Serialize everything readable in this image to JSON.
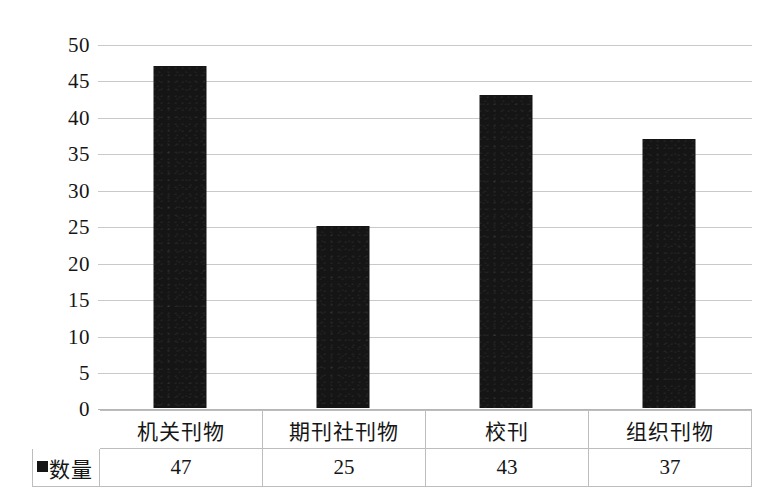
{
  "chart_data": {
    "type": "bar",
    "title": "",
    "subtitle": "",
    "xlabel": "",
    "ylabel": "",
    "categories": [
      "机关刊物",
      "期刊社刊物",
      "校刊",
      "组织刊物"
    ],
    "values": [
      47,
      25,
      43,
      37
    ],
    "series": [
      {
        "name": "数量",
        "values": [
          47,
          25,
          43,
          37
        ]
      }
    ],
    "ylim": [
      0,
      50
    ],
    "ytick_step": 5,
    "yticks": [
      50,
      45,
      40,
      35,
      30,
      25,
      20,
      15,
      10,
      5,
      0
    ],
    "ytick_labels": [
      "50",
      "45",
      "40",
      "35",
      "30",
      "25",
      "20",
      "15",
      "10",
      "5",
      "0"
    ],
    "grid": true,
    "grid_axis": "y",
    "legend_position": "data-table-row-header",
    "bar_color": "#151515",
    "gridline_color": "#c9c9c9",
    "background_color": "#ffffff"
  },
  "legend": {
    "marker_name": "series-color-swatch",
    "label": "数量"
  },
  "table": {
    "category_header_row": [
      "机关刊物",
      "期刊社刊物",
      "校刊",
      "组织刊物"
    ],
    "value_row": [
      "47",
      "25",
      "43",
      "37"
    ],
    "border_color": "#bdbdbd"
  }
}
